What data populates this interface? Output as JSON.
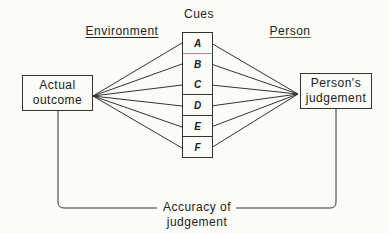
{
  "diagram": {
    "title": "Cues",
    "left_heading": "Environment",
    "right_heading": "Person",
    "left_box": "Actual outcome",
    "left_box_lines": [
      "Actual",
      "outcome"
    ],
    "right_box_lines": [
      "Person's",
      "judgement"
    ],
    "cues": [
      "A",
      "B",
      "C",
      "D",
      "E",
      "F"
    ],
    "bottom_label_lines": [
      "Accuracy of",
      "judgement"
    ],
    "colors": {
      "line": "#333333",
      "right_heading_underline": "#c0303a",
      "left_heading_underline": "#333333"
    }
  }
}
